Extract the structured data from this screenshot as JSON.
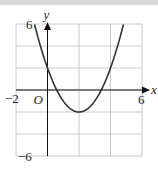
{
  "chart_data": {
    "type": "line",
    "title": "",
    "xlabel": "x",
    "ylabel": "y",
    "origin_label": "O",
    "xlim": [
      -2,
      6
    ],
    "ylim": [
      -6,
      6
    ],
    "grid": true,
    "grid_step": 2,
    "tick_labels": {
      "x_min": "−2",
      "x_max": "6",
      "y_max": "6",
      "y_min": "−6"
    },
    "function": "y = x^2 - 4x + 2",
    "series": [
      {
        "name": "parabola",
        "coefficients": [
          1,
          -4,
          2
        ],
        "vertex": [
          2,
          -2
        ],
        "y_intercept": 2
      }
    ],
    "colors": {
      "curve": "#333333",
      "grid": "#bdbdbd",
      "axes": "#111111"
    }
  }
}
